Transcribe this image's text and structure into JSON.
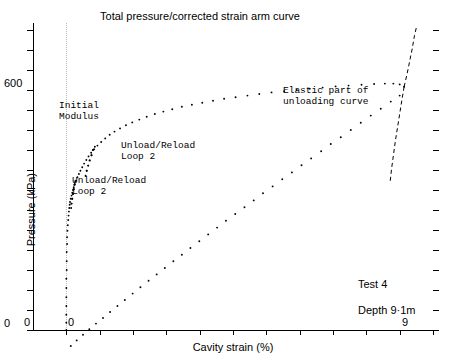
{
  "figure": {
    "title": "Total pressure/corrected strain arm curve",
    "test_label": "Test 4",
    "depth_label": "Depth 9·1m"
  },
  "annotations": {
    "initial_modulus": "Initial\nModulus",
    "unload_reload_upper": "Unload/Reload\nLoop 2",
    "unload_reload_lower": "Unload/Reload\nLoop 2",
    "elastic_unloading": "Elastic part of\nunloading curve"
  },
  "axes": {
    "y": {
      "label": "Pressure (kPa)",
      "ticks": [
        {
          "value": 0,
          "label": "0"
        },
        {
          "value": 50,
          "label": ""
        },
        {
          "value": 100,
          "label": ""
        },
        {
          "value": 150,
          "label": ""
        },
        {
          "value": 200,
          "label": ""
        },
        {
          "value": 250,
          "label": ""
        },
        {
          "value": 300,
          "label": ""
        },
        {
          "value": 350,
          "label": ""
        },
        {
          "value": 400,
          "label": ""
        },
        {
          "value": 450,
          "label": ""
        },
        {
          "value": 500,
          "label": ""
        },
        {
          "value": 550,
          "label": ""
        },
        {
          "value": 600,
          "label": "600"
        },
        {
          "value": 650,
          "label": ""
        },
        {
          "value": 700,
          "label": ""
        },
        {
          "value": 750,
          "label": ""
        }
      ],
      "zero_origin_label": "0",
      "min": 0,
      "max": 767.5
    },
    "x": {
      "label": "Cavity strain (%)",
      "ticks": [
        {
          "value": -0.9,
          "label": "0"
        },
        {
          "value": 0.0,
          "label": "0"
        },
        {
          "value": 0.9,
          "label": ""
        },
        {
          "value": 1.8,
          "label": ""
        },
        {
          "value": 2.7,
          "label": ""
        },
        {
          "value": 3.6,
          "label": ""
        },
        {
          "value": 4.5,
          "label": ""
        },
        {
          "value": 5.4,
          "label": ""
        },
        {
          "value": 6.3,
          "label": ""
        },
        {
          "value": 7.2,
          "label": ""
        },
        {
          "value": 8.1,
          "label": ""
        },
        {
          "value": 9.0,
          "label": "9"
        },
        {
          "value": 9.9,
          "label": ""
        }
      ],
      "min": -0.9,
      "max": 9.9
    }
  },
  "chart_data": {
    "type": "scatter",
    "title": "Total pressure/corrected strain arm curve",
    "xlabel": "Cavity strain (%)",
    "ylabel": "Pressure (kPa)",
    "xlim": [
      -0.9,
      9.9
    ],
    "ylim": [
      0,
      767.5
    ],
    "grid": false,
    "legend": "none",
    "series": [
      {
        "name": "Total pressure / corrected strain arm (loading)",
        "style": "dotted",
        "color": "#000000",
        "points": [
          [
            0.0,
            0
          ],
          [
            0.0,
            18
          ],
          [
            0.0,
            38
          ],
          [
            0.0,
            60
          ],
          [
            0.0,
            82
          ],
          [
            0.0,
            105
          ],
          [
            0.0,
            128
          ],
          [
            0.01,
            150
          ],
          [
            0.01,
            172
          ],
          [
            0.01,
            195
          ],
          [
            0.02,
            215
          ],
          [
            0.02,
            232
          ],
          [
            0.03,
            248
          ],
          [
            0.04,
            262
          ],
          [
            0.05,
            275
          ],
          [
            0.06,
            286
          ],
          [
            0.07,
            296
          ],
          [
            0.08,
            305
          ],
          [
            0.09,
            313
          ],
          [
            0.1,
            320
          ],
          [
            0.12,
            328
          ],
          [
            0.14,
            336
          ],
          [
            0.16,
            343
          ],
          [
            0.18,
            350
          ],
          [
            0.2,
            357
          ],
          [
            0.23,
            365
          ],
          [
            0.26,
            373
          ],
          [
            0.3,
            382
          ],
          [
            0.34,
            390
          ],
          [
            0.38,
            398
          ],
          [
            0.43,
            407
          ],
          [
            0.48,
            416
          ],
          [
            0.54,
            425
          ],
          [
            0.6,
            434
          ],
          [
            0.67,
            443
          ],
          [
            0.75,
            452
          ],
          [
            0.84,
            461
          ],
          [
            0.94,
            470
          ],
          [
            1.05,
            479
          ],
          [
            1.17,
            488
          ],
          [
            1.3,
            496
          ],
          [
            1.45,
            504
          ],
          [
            1.61,
            512
          ],
          [
            1.78,
            519
          ],
          [
            1.97,
            526
          ],
          [
            2.17,
            533
          ],
          [
            2.39,
            540
          ],
          [
            2.62,
            546
          ],
          [
            2.86,
            552
          ],
          [
            3.12,
            558
          ],
          [
            3.39,
            563
          ],
          [
            3.67,
            568
          ],
          [
            3.96,
            573
          ],
          [
            4.26,
            578
          ],
          [
            4.57,
            582
          ],
          [
            4.89,
            586
          ],
          [
            5.21,
            590
          ],
          [
            5.54,
            594
          ],
          [
            5.88,
            597
          ],
          [
            6.22,
            600
          ],
          [
            6.57,
            603
          ],
          [
            6.92,
            606
          ],
          [
            7.27,
            609
          ],
          [
            7.62,
            611
          ],
          [
            7.97,
            613
          ],
          [
            8.31,
            615
          ],
          [
            8.6,
            616
          ],
          [
            8.83,
            616
          ],
          [
            9.0,
            614
          ],
          [
            9.12,
            608
          ]
        ]
      },
      {
        "name": "Elastic part of unloading curve",
        "style": "dashed",
        "color": "#000000",
        "points": [
          [
            9.12,
            608
          ],
          [
            9.2,
            640
          ],
          [
            9.27,
            672
          ],
          [
            9.34,
            704
          ],
          [
            9.4,
            736
          ],
          [
            9.46,
            760
          ]
        ]
      },
      {
        "name": "Unloading curve (lower branch)",
        "style": "dashed",
        "color": "#000000",
        "points": [
          [
            9.12,
            608
          ],
          [
            9.06,
            575
          ],
          [
            9.0,
            540
          ],
          [
            8.94,
            505
          ],
          [
            8.88,
            470
          ],
          [
            8.83,
            436
          ],
          [
            8.78,
            402
          ],
          [
            8.74,
            368
          ]
        ]
      },
      {
        "name": "Uncorrected strain arm reading",
        "style": "dotted",
        "color": "#000000",
        "points": [
          [
            0.12,
            -40
          ],
          [
            0.28,
            -26
          ],
          [
            0.45,
            -12
          ],
          [
            0.62,
            2
          ],
          [
            0.8,
            16
          ],
          [
            0.99,
            30
          ],
          [
            1.18,
            45
          ],
          [
            1.38,
            60
          ],
          [
            1.58,
            75
          ],
          [
            1.79,
            91
          ],
          [
            2.0,
            107
          ],
          [
            2.22,
            123
          ],
          [
            2.44,
            139
          ],
          [
            2.66,
            155
          ],
          [
            2.89,
            172
          ],
          [
            3.12,
            188
          ],
          [
            3.35,
            205
          ],
          [
            3.59,
            222
          ],
          [
            3.83,
            239
          ],
          [
            4.07,
            256
          ],
          [
            4.31,
            273
          ],
          [
            4.56,
            290
          ],
          [
            4.81,
            307
          ],
          [
            5.06,
            324
          ],
          [
            5.31,
            342
          ],
          [
            5.57,
            359
          ],
          [
            5.83,
            377
          ],
          [
            6.09,
            394
          ],
          [
            6.35,
            412
          ],
          [
            6.61,
            429
          ],
          [
            6.88,
            447
          ],
          [
            7.14,
            465
          ],
          [
            7.41,
            482
          ],
          [
            7.68,
            500
          ],
          [
            7.95,
            518
          ],
          [
            8.22,
            536
          ],
          [
            8.49,
            553
          ],
          [
            8.76,
            571
          ],
          [
            9.0,
            586
          ]
        ]
      },
      {
        "name": "Unload/Reload Loop 1 (lower)",
        "style": "dotted",
        "color": "#000000",
        "points": [
          [
            0.22,
            363
          ],
          [
            0.2,
            352
          ],
          [
            0.18,
            340
          ],
          [
            0.16,
            328
          ],
          [
            0.14,
            316
          ],
          [
            0.13,
            305
          ],
          [
            0.14,
            316
          ],
          [
            0.16,
            328
          ],
          [
            0.18,
            340
          ],
          [
            0.2,
            352
          ],
          [
            0.22,
            363
          ],
          [
            0.24,
            372
          ]
        ]
      },
      {
        "name": "Unload/Reload Loop 2 (upper)",
        "style": "dotted",
        "color": "#000000",
        "points": [
          [
            0.72,
            450
          ],
          [
            0.68,
            437
          ],
          [
            0.63,
            424
          ],
          [
            0.59,
            411
          ],
          [
            0.55,
            398
          ],
          [
            0.52,
            386
          ],
          [
            0.55,
            398
          ],
          [
            0.59,
            411
          ],
          [
            0.63,
            424
          ],
          [
            0.68,
            437
          ],
          [
            0.72,
            450
          ],
          [
            0.77,
            458
          ]
        ]
      }
    ]
  }
}
